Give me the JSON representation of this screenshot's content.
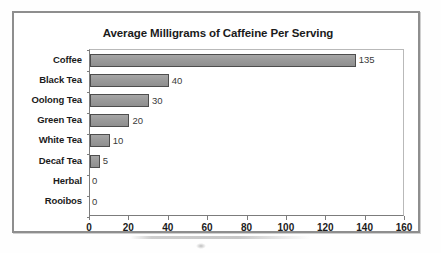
{
  "chart_data": {
    "type": "bar",
    "orientation": "horizontal",
    "title": "Average Milligrams of Caffeine Per Serving",
    "xlabel": "",
    "ylabel": "",
    "categories": [
      "Coffee",
      "Black Tea",
      "Oolong Tea",
      "Green Tea",
      "White Tea",
      "Decaf Tea",
      "Herbal",
      "Rooibos"
    ],
    "values": [
      135,
      40,
      30,
      20,
      10,
      5,
      0,
      0
    ],
    "data_labels": [
      "135",
      "40",
      "30",
      "20",
      "10",
      "5",
      "0",
      "0"
    ],
    "xlim": [
      0,
      160
    ],
    "xticks": [
      0,
      20,
      40,
      60,
      80,
      100,
      120,
      140,
      160
    ],
    "xtick_labels": [
      "0",
      "20",
      "40",
      "60",
      "80",
      "100",
      "120",
      "140",
      "160"
    ],
    "grid": false,
    "legend": false,
    "bar_color": "#9a9a9a",
    "bar_border_color": "#4d4d4d",
    "text_color": "#1b1b1b",
    "frame_color": "#8e8e8e",
    "axis_color": "#7c7c7c",
    "background": "#ffffff"
  }
}
